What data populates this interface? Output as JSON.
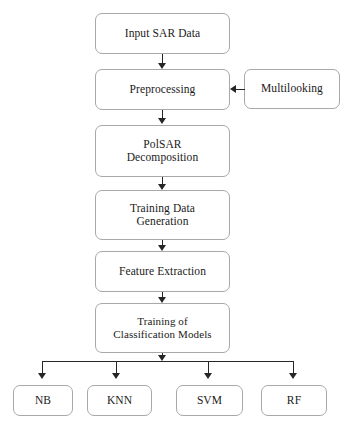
{
  "diagram": {
    "background_color": "#ffffff",
    "box_border_color": "#a8a8a8",
    "connector_color": "#262626",
    "text_color": "#1a1a1a"
  },
  "nodes": {
    "input_sar_data": "Input SAR Data",
    "preprocessing": "Preprocessing",
    "multilooking": "Multilooking",
    "polsar_decomposition": "PolSAR\nDecomposition",
    "training_data_generation": "Training Data\nGeneration",
    "feature_extraction": "Feature Extraction",
    "training_of_classification_models": "Training of\nClassification Models"
  },
  "classifiers": [
    {
      "id": "nb",
      "label": "NB"
    },
    {
      "id": "knn",
      "label": "KNN"
    },
    {
      "id": "svm",
      "label": "SVM"
    },
    {
      "id": "rf",
      "label": "RF"
    }
  ],
  "connectors": [
    {
      "from": "input_sar_data",
      "to": "preprocessing",
      "direction": "down"
    },
    {
      "from": "multilooking",
      "to": "preprocessing",
      "direction": "left"
    },
    {
      "from": "preprocessing",
      "to": "polsar_decomposition",
      "direction": "down"
    },
    {
      "from": "polsar_decomposition",
      "to": "training_data_generation",
      "direction": "down"
    },
    {
      "from": "training_data_generation",
      "to": "feature_extraction",
      "direction": "down"
    },
    {
      "from": "feature_extraction",
      "to": "training_of_classification_models",
      "direction": "down"
    },
    {
      "from": "training_of_classification_models",
      "to": "nb",
      "direction": "down"
    },
    {
      "from": "training_of_classification_models",
      "to": "knn",
      "direction": "down"
    },
    {
      "from": "training_of_classification_models",
      "to": "svm",
      "direction": "down"
    },
    {
      "from": "training_of_classification_models",
      "to": "rf",
      "direction": "down"
    }
  ]
}
